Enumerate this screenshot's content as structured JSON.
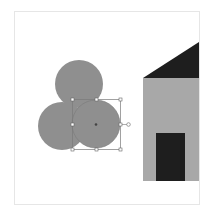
{
  "colors": {
    "background": "#ffffff",
    "page_border": "#e6e6e6",
    "circle_fill": "#8f8f8f",
    "house_wall": "#a8a8a8",
    "house_roof": "#1e1e1e",
    "house_door": "#1e1e1e",
    "selection_stroke": "#7a7a7a",
    "handle_fill": "#ffffff",
    "center_dot": "#444444"
  },
  "shapes": {
    "circles": [
      {
        "name": "top-circle",
        "cx": 79,
        "cy": 84,
        "r": 24
      },
      {
        "name": "left-circle",
        "cx": 62,
        "cy": 126,
        "r": 24
      },
      {
        "name": "right-circle-selected",
        "cx": 96,
        "cy": 124,
        "r": 24
      }
    ],
    "selection": {
      "x": 72,
      "y": 99,
      "width": 49,
      "height": 51
    },
    "house": {
      "roof_points": "143,78 199,42 199,78",
      "wall": {
        "x": 143,
        "y": 78,
        "width": 56,
        "height": 103
      },
      "door": {
        "x": 156,
        "y": 133,
        "width": 29,
        "height": 48
      }
    }
  }
}
